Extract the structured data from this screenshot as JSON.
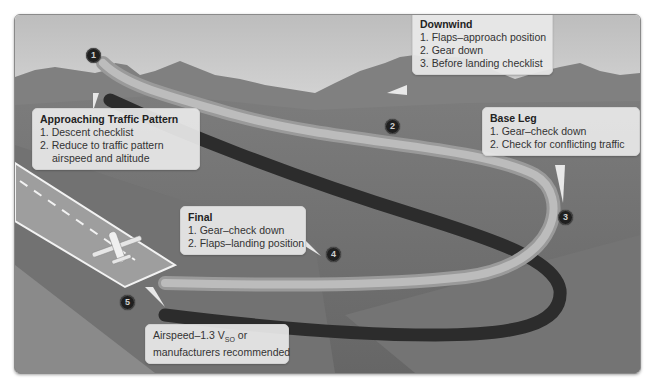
{
  "diagram": {
    "colors": {
      "sky_top": "#bdbdbd",
      "sky_bottom": "#f6f6f6",
      "mountains": "#7a7a7a",
      "ground": "#6e6e6e",
      "path_light": "#a8a8a8",
      "path_shadow": "#2e2e2e",
      "runway": "#9a9a9a",
      "callout_bg": "#e8e8e8",
      "marker": "#1f1f1f"
    },
    "callouts": [
      {
        "id": "approaching",
        "marker": "1",
        "title": "Approaching Traffic Pattern",
        "items": [
          "1. Descent checklist",
          "2. Reduce to traffic pattern",
          "airspeed and altitude"
        ]
      },
      {
        "id": "downwind",
        "marker": "2",
        "title": "Downwind",
        "items": [
          "1. Flaps–approach position",
          "2. Gear down",
          "3. Before landing checklist"
        ]
      },
      {
        "id": "base",
        "marker": "3",
        "title": "Base Leg",
        "items": [
          "1. Gear–check down",
          "2. Check for conflicting traffic"
        ]
      },
      {
        "id": "final",
        "marker": "4",
        "title": "Final",
        "items": [
          "1. Gear–check down",
          "2. Flaps–landing position"
        ]
      },
      {
        "id": "touchdown",
        "marker": "5",
        "line1_prefix": "Airspeed–1.3 V",
        "line1_sub": "SO",
        "line1_suffix": " or",
        "line2": "manufacturers recommended"
      }
    ]
  }
}
